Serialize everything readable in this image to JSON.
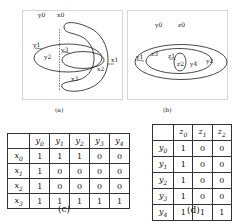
{
  "panel_a": {
    "caption": "(a)",
    "labels": {
      "y0": "y0",
      "x0": "x0",
      "y1": "y1",
      "y2": "y2",
      "y3": "y3",
      "x1": "x1",
      "x2": "x2",
      "x3": "x3"
    }
  },
  "panel_b": {
    "caption": "(b)",
    "labels": {
      "y0": "y0",
      "z0": "z0",
      "y1": "y1",
      "z3": "z3",
      "z1": "z1",
      "z2": "z2",
      "y4": "y4",
      "y2": "y2"
    }
  },
  "table_c": {
    "caption": "(c)",
    "columns": [
      "y",
      "y",
      "y",
      "y",
      "y"
    ],
    "column_subs": [
      "0",
      "1",
      "2",
      "3",
      "4"
    ],
    "rows": [
      {
        "head": "x",
        "sub": "0",
        "cells": [
          "1",
          "1",
          "1",
          "0",
          "0"
        ]
      },
      {
        "head": "x",
        "sub": "1",
        "cells": [
          "1",
          "0",
          "0",
          "0",
          "0"
        ]
      },
      {
        "head": "x",
        "sub": "2",
        "cells": [
          "1",
          "0",
          "0",
          "0",
          "0"
        ]
      },
      {
        "head": "x",
        "sub": "3",
        "cells": [
          "1",
          "1",
          "1",
          "1",
          "1"
        ]
      }
    ]
  },
  "table_d": {
    "caption": "(d)",
    "columns": [
      "z",
      "z",
      "z"
    ],
    "column_subs": [
      "0",
      "1",
      "2"
    ],
    "rows": [
      {
        "head": "y",
        "sub": "0",
        "cells": [
          "1",
          "0",
          "0"
        ]
      },
      {
        "head": "y",
        "sub": "1",
        "cells": [
          "1",
          "0",
          "0"
        ]
      },
      {
        "head": "y",
        "sub": "2",
        "cells": [
          "1",
          "0",
          "0"
        ]
      },
      {
        "head": "y",
        "sub": "3",
        "cells": [
          "1",
          "0",
          "0"
        ]
      },
      {
        "head": "y",
        "sub": "4",
        "cells": [
          "1",
          "1",
          "1"
        ]
      }
    ]
  },
  "colors": {
    "stroke": "#333333",
    "frame": "#999999",
    "background": "#ffffff"
  }
}
